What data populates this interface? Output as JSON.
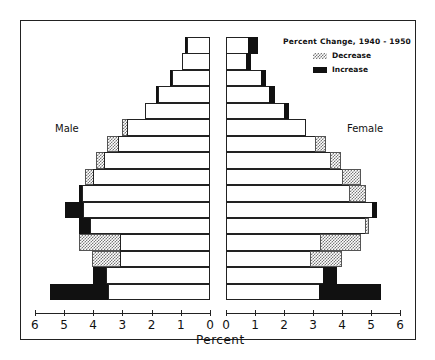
{
  "chart_data": {
    "type": "bar",
    "subtype": "population-pyramid",
    "title": "Percent Change, 1940 - 1950",
    "xlabel": "Percent",
    "ylabel": "",
    "xlim": [
      0,
      6
    ],
    "x_ticks_left": [
      "6",
      "5",
      "4",
      "3",
      "2",
      "1",
      "0"
    ],
    "x_ticks_right": [
      "0",
      "1",
      "2",
      "3",
      "4",
      "5",
      "6"
    ],
    "legend": [
      {
        "label": "Decrease",
        "pattern": "crosshatch"
      },
      {
        "label": "Increase",
        "pattern": "solid-black"
      }
    ],
    "legend_position": "upper-right",
    "grid": false,
    "side_labels": {
      "left": "Male",
      "right": "Female"
    },
    "row_order": "top-to-bottom (oldest age group at top, youngest at bottom); age group labels not shown",
    "series": [
      {
        "name": "Male",
        "side": "left",
        "rows": [
          {
            "base": 0.79,
            "extent": 0.86,
            "change": "increase"
          },
          {
            "base": 0.96,
            "extent": 0.96,
            "change": "none"
          },
          {
            "base": 1.3,
            "extent": 1.37,
            "change": "increase"
          },
          {
            "base": 1.78,
            "extent": 1.85,
            "change": "increase"
          },
          {
            "base": 2.23,
            "extent": 2.23,
            "change": "none"
          },
          {
            "base": 2.84,
            "extent": 3.01,
            "change": "decrease"
          },
          {
            "base": 3.15,
            "extent": 3.53,
            "change": "decrease"
          },
          {
            "base": 3.63,
            "extent": 3.9,
            "change": "decrease"
          },
          {
            "base": 4.01,
            "extent": 4.28,
            "change": "decrease"
          },
          {
            "base": 4.38,
            "extent": 4.49,
            "change": "increase"
          },
          {
            "base": 4.35,
            "extent": 4.97,
            "change": "increase"
          },
          {
            "base": 4.11,
            "extent": 4.49,
            "change": "increase"
          },
          {
            "base": 3.08,
            "extent": 4.49,
            "change": "decrease"
          },
          {
            "base": 3.08,
            "extent": 4.04,
            "change": "decrease"
          },
          {
            "base": 3.56,
            "extent": 4.01,
            "change": "increase"
          },
          {
            "base": 3.49,
            "extent": 5.48,
            "change": "increase"
          }
        ]
      },
      {
        "name": "Female",
        "side": "right",
        "rows": [
          {
            "base": 0.79,
            "extent": 1.1,
            "change": "increase"
          },
          {
            "base": 0.72,
            "extent": 0.86,
            "change": "increase"
          },
          {
            "base": 1.24,
            "extent": 1.38,
            "change": "increase"
          },
          {
            "base": 1.52,
            "extent": 1.69,
            "change": "increase"
          },
          {
            "base": 2.03,
            "extent": 2.17,
            "change": "increase"
          },
          {
            "base": 2.76,
            "extent": 2.76,
            "change": "none"
          },
          {
            "base": 3.1,
            "extent": 3.45,
            "change": "decrease"
          },
          {
            "base": 3.62,
            "extent": 3.97,
            "change": "decrease"
          },
          {
            "base": 4.03,
            "extent": 4.66,
            "change": "decrease"
          },
          {
            "base": 4.28,
            "extent": 4.83,
            "change": "decrease"
          },
          {
            "base": 5.07,
            "extent": 5.21,
            "change": "increase"
          },
          {
            "base": 4.83,
            "extent": 4.93,
            "change": "decrease"
          },
          {
            "base": 3.28,
            "extent": 4.66,
            "change": "decrease"
          },
          {
            "base": 2.93,
            "extent": 4.0,
            "change": "decrease"
          },
          {
            "base": 3.38,
            "extent": 3.83,
            "change": "increase"
          },
          {
            "base": 3.24,
            "extent": 5.34,
            "change": "increase"
          }
        ]
      }
    ]
  },
  "labels": {
    "title": "Percent Change,   1940 - 1950",
    "legend_decrease": "Decrease",
    "legend_increase": "Increase",
    "male": "Male",
    "female": "Female",
    "xlabel": "Percent"
  }
}
